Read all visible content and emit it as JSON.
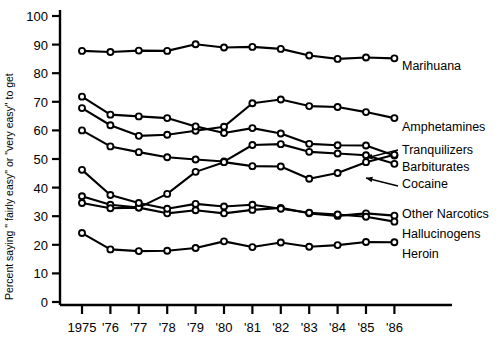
{
  "chart_data": {
    "type": "line",
    "title": "",
    "subtitle": "",
    "xlabel": "",
    "ylabel": "Percent saying \" fairly easy\" or \"very easy\" to get",
    "x": [
      1975,
      1976,
      1977,
      1978,
      1979,
      1980,
      1981,
      1982,
      1983,
      1984,
      1985,
      1986
    ],
    "xticklabels": [
      "1975",
      "'76",
      "'77",
      "'78",
      "'79",
      "'80",
      "'81",
      "'82",
      "'83",
      "'84",
      "'85",
      "'86"
    ],
    "yticklabels": [
      "0",
      "10",
      "20",
      "30",
      "40",
      "50",
      "60",
      "70",
      "80",
      "90",
      "100"
    ],
    "ylim": [
      0,
      100
    ],
    "ytick_step": 10,
    "grid": false,
    "legend_position": "right-inline-labels",
    "series": [
      {
        "name": "Marihuana",
        "values": [
          87.8,
          87.4,
          87.9,
          87.8,
          90.1,
          89.0,
          89.2,
          88.5,
          86.2,
          85.0,
          85.5,
          85.2
        ]
      },
      {
        "name": "Amphetamines",
        "values": [
          67.8,
          61.8,
          58.1,
          58.5,
          59.9,
          61.3,
          69.5,
          70.8,
          68.5,
          68.2,
          66.4,
          64.3
        ]
      },
      {
        "name": "Tranquilizers",
        "values": [
          71.8,
          65.5,
          64.9,
          64.3,
          61.4,
          59.1,
          60.8,
          58.9,
          55.3,
          54.8,
          54.7,
          51.2
        ]
      },
      {
        "name": "Barbiturates",
        "values": [
          60.0,
          54.4,
          52.4,
          50.6,
          49.8,
          49.1,
          54.9,
          55.2,
          52.5,
          51.9,
          51.3,
          48.3
        ]
      },
      {
        "name": "Cocaine",
        "values": [
          37.0,
          34.0,
          33.0,
          37.8,
          45.5,
          48.9,
          47.5,
          47.4,
          43.1,
          45.1,
          48.9,
          51.5
        ]
      },
      {
        "name": "Other Narcotics",
        "values": [
          34.6,
          32.8,
          33.0,
          31.0,
          32.1,
          31.0,
          32.2,
          32.9,
          31.0,
          30.1,
          31.0,
          30.2
        ]
      },
      {
        "name": "Hallucinogens",
        "values": [
          46.2,
          37.4,
          34.6,
          32.6,
          34.3,
          33.4,
          34.0,
          32.6,
          31.2,
          30.6,
          29.8,
          28.1
        ]
      },
      {
        "name": "Heroin",
        "values": [
          24.1,
          18.4,
          17.8,
          17.9,
          18.9,
          21.2,
          19.2,
          20.8,
          19.3,
          19.9,
          21.0,
          20.9
        ]
      }
    ],
    "annotations": [
      {
        "text": "Tranquilizers",
        "leader": true
      },
      {
        "text": "Cocaine",
        "leader": true
      }
    ]
  },
  "labels": {
    "marihuana": "Marihuana",
    "amphetamines": "Amphetamines",
    "tranquilizers": "Tranquilizers",
    "barbiturates": "Barbiturates",
    "cocaine": "Cocaine",
    "other_narcotics": "Other Narcotics",
    "hallucinogens": "Hallucinogens",
    "heroin": "Heroin"
  },
  "axis": {
    "y_title": "Percent saying \" fairly easy\" or \"very easy\" to get",
    "y_ticks": [
      "100",
      "90",
      "80",
      "70",
      "60",
      "50",
      "40",
      "30",
      "20",
      "10",
      "0"
    ],
    "x_ticks": [
      "1975",
      "'76",
      "'77",
      "'78",
      "'79",
      "'80",
      "'81",
      "'82",
      "'83",
      "'84",
      "'85",
      "'86"
    ]
  }
}
